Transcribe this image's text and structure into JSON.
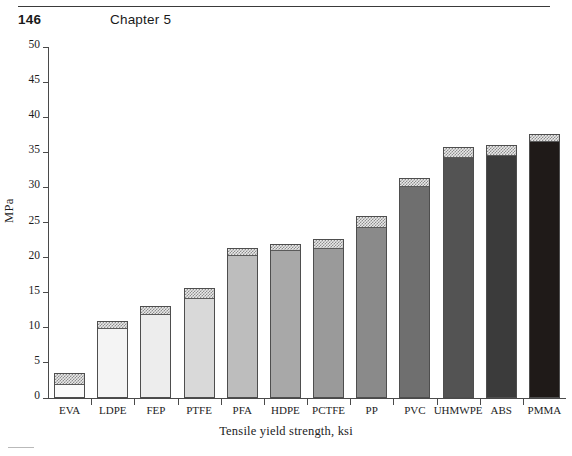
{
  "header": {
    "page_number": "146",
    "chapter_title": "Chapter 5"
  },
  "chart_data": {
    "type": "bar",
    "title": "",
    "xlabel": "Tensile yield strength, ksi",
    "ylabel": "MPa",
    "ylim": [
      0,
      50
    ],
    "ytick_labels": [
      "0",
      "5",
      "10",
      "15",
      "20",
      "25",
      "30",
      "35",
      "40",
      "45",
      "50"
    ],
    "ytick_values": [
      0,
      5,
      10,
      15,
      20,
      25,
      30,
      35,
      40,
      45,
      50
    ],
    "grid": false,
    "legend": "none",
    "categories": [
      "EVA",
      "LDPE",
      "FEP",
      "PTFE",
      "PFA",
      "HDPE",
      "PCTFE",
      "PP",
      "PVC",
      "UHMWPE",
      "ABS",
      "PMMA"
    ],
    "values": [
      3.5,
      10.9,
      13.1,
      15.6,
      21.4,
      21.9,
      22.7,
      25.9,
      31.3,
      35.7,
      36.1,
      37.6
    ],
    "range_low": [
      2.0,
      9.9,
      11.9,
      14.3,
      20.3,
      21.1,
      21.3,
      24.4,
      30.2,
      34.3,
      34.6,
      36.6
    ],
    "bar_colors": [
      "#fbfbfb",
      "#f4f4f4",
      "#ededed",
      "#d9d9d9",
      "#bdbdbd",
      "#a8a8a8",
      "#9a9a9a",
      "#8a8a8a",
      "#6f6f6f",
      "#535353",
      "#3b3b3b",
      "#1f1a18"
    ],
    "cap_style": "hatched"
  }
}
